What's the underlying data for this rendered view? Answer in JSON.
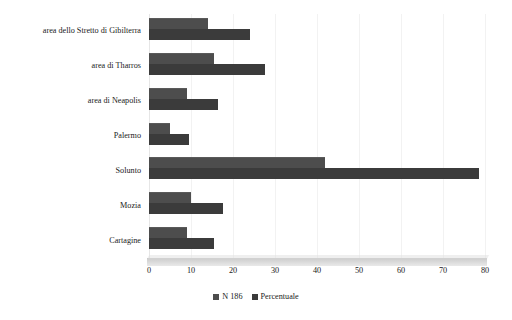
{
  "chart_data": {
    "type": "bar",
    "orientation": "horizontal",
    "title": "",
    "xlabel": "",
    "ylabel": "",
    "xlim": [
      0,
      80
    ],
    "xticks": [
      0,
      10,
      20,
      30,
      40,
      50,
      60,
      70,
      80
    ],
    "grid": true,
    "legend_position": "bottom",
    "categories": [
      "area dello Stretto di Gibilterra",
      "area di Tharros",
      "area di Neapolis",
      "Palermo",
      "Solunto",
      "Mozia",
      "Cartagine"
    ],
    "series": [
      {
        "name": "N 186",
        "color": "#4d4d4d",
        "values": [
          14,
          15.5,
          9,
          5,
          42,
          10,
          9
        ]
      },
      {
        "name": "Percentuale",
        "color": "#3b3b3b",
        "values": [
          24,
          27.5,
          16.5,
          9.5,
          78.5,
          17.5,
          15.5
        ]
      }
    ]
  },
  "legend": {
    "items": [
      {
        "label": "N 186",
        "color": "#4d4d4d"
      },
      {
        "label": "Percentuale",
        "color": "#3b3b3b"
      }
    ]
  },
  "axis": {
    "x_tick_labels": [
      "0",
      "10",
      "20",
      "30",
      "40",
      "50",
      "60",
      "70",
      "80"
    ]
  }
}
